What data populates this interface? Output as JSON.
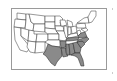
{
  "map": {
    "subject": "United States map",
    "highlight_color": "#8a8a8a",
    "base_color": "#ffffff",
    "highlighted_states": [
      "Texas",
      "Louisiana",
      "Arkansas",
      "Mississippi",
      "Alabama",
      "Georgia",
      "Florida",
      "South Carolina",
      "North Carolina",
      "Tennessee",
      "Virginia"
    ]
  }
}
